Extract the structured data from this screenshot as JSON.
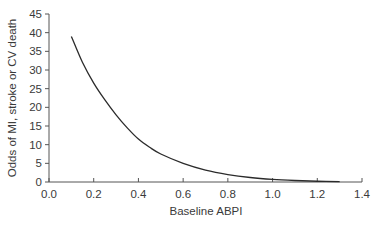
{
  "chart_data": {
    "type": "line",
    "title": "",
    "xlabel": "Baseline ABPI",
    "ylabel": "Odds of MI, stroke or CV death",
    "xlim": [
      0.0,
      1.4
    ],
    "ylim": [
      0,
      45
    ],
    "x_ticks": [
      "0.0",
      "0.2",
      "0.4",
      "0.6",
      "0.8",
      "1.0",
      "1.2",
      "1.4"
    ],
    "y_ticks": [
      "0",
      "5",
      "10",
      "15",
      "20",
      "25",
      "30",
      "35",
      "40",
      "45"
    ],
    "grid": false,
    "legend": null,
    "series": [
      {
        "name": "Odds curve",
        "color": "#2b2b2b",
        "x": [
          0.1,
          0.15,
          0.2,
          0.25,
          0.3,
          0.35,
          0.4,
          0.45,
          0.5,
          0.6,
          0.7,
          0.8,
          0.9,
          1.0,
          1.1,
          1.2,
          1.3
        ],
        "y": [
          39,
          32,
          26.5,
          22,
          18,
          14.5,
          11.5,
          9.3,
          7.5,
          5,
          3.2,
          2,
          1.2,
          0.7,
          0.4,
          0.2,
          0.1
        ]
      }
    ]
  }
}
